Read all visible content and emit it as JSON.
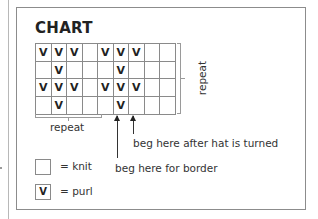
{
  "title": "CHART",
  "symbols": {
    "purl": "V",
    "knit": ""
  },
  "grid": {
    "columns": 9,
    "rows": [
      [
        "V",
        "V",
        "V",
        "",
        "V",
        "V",
        "V",
        "",
        ""
      ],
      [
        "",
        "V",
        "",
        "",
        "",
        "V",
        "",
        "",
        ""
      ],
      [
        "V",
        "V",
        "V",
        "",
        "V",
        "V",
        "V",
        "",
        ""
      ],
      [
        "",
        "V",
        "",
        "",
        "",
        "V",
        "",
        "",
        ""
      ]
    ]
  },
  "annotations": {
    "repeat_vertical": "repeat",
    "repeat_horizontal": "repeat",
    "beg_after_turned": "beg here after hat is turned",
    "beg_border": "beg here for border"
  },
  "legend": [
    {
      "symbol": "",
      "label": "= knit"
    },
    {
      "symbol": "V",
      "label": "= purl"
    }
  ],
  "colors": {
    "border": "#8c8c8c",
    "text": "#2a2a2a",
    "background": "#ffffff"
  }
}
